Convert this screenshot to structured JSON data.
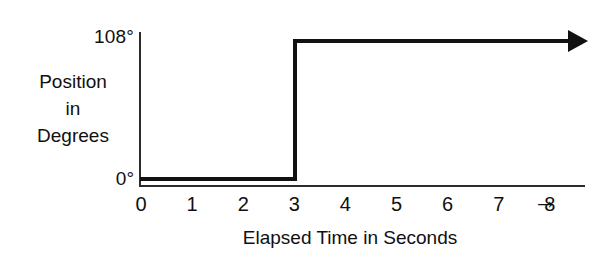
{
  "chart_data": {
    "type": "line",
    "subtype": "step",
    "title": "",
    "xlabel": "Elapsed Time in Seconds",
    "ylabel": "Position in Degrees",
    "ylabel_lines": [
      "Position",
      "in",
      "Degrees"
    ],
    "x": [
      0,
      3,
      3,
      8.7
    ],
    "values": [
      0,
      0,
      108,
      108
    ],
    "xlim": [
      0,
      8.7
    ],
    "ylim": [
      0,
      108
    ],
    "xticks": [
      0,
      1,
      2,
      3,
      4,
      5,
      6,
      7,
      8
    ],
    "xticklabels": [
      "0",
      "1",
      "2",
      "3",
      "4",
      "5",
      "6",
      "7",
      "8"
    ],
    "yticks": [
      0,
      108
    ],
    "yticklabels": [
      "0°",
      "108°"
    ],
    "grid": false,
    "legend": false,
    "series": [
      {
        "name": "Position",
        "x": [
          0,
          3,
          3,
          8.7
        ],
        "values": [
          0,
          0,
          108,
          108
        ]
      }
    ],
    "annotations": {
      "step_time_seconds": 3,
      "low_value": "0°",
      "high_value": "108°",
      "trace_end_arrow": "arrow-right",
      "x_axis_end_arrow": "→"
    },
    "colors": {
      "line": "#111111",
      "axis": "#2b2b2b",
      "background": "#ffffff",
      "text": "#101010"
    }
  },
  "axis_labels": {
    "y_top": "108°",
    "y_bottom": "0°",
    "y_title_line1": "Position",
    "y_title_line2": "in",
    "y_title_line3": "Degrees",
    "x_title": "Elapsed Time in Seconds",
    "x_end_arrow": "→"
  }
}
